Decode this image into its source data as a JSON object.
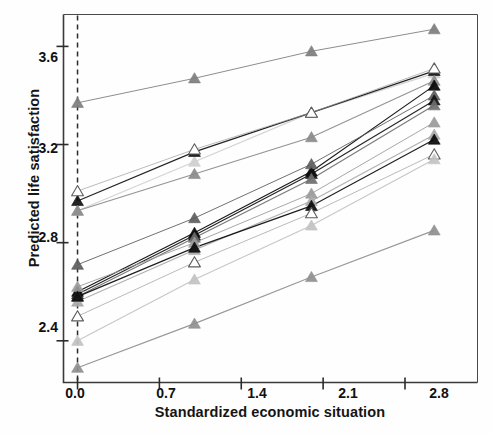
{
  "chart_data": {
    "type": "line",
    "title": "",
    "xlabel": "Standardized economic situation",
    "ylabel": "Predicted life satisfaction",
    "xlim": [
      -0.12,
      3.42
    ],
    "ylim": [
      2.23,
      3.73
    ],
    "xticks": [
      0.0,
      0.7,
      1.4,
      2.1,
      2.8
    ],
    "xtick_labels": [
      "0.0",
      "0.7",
      "1.4",
      "2.1",
      "2.8"
    ],
    "yticks": [
      2.4,
      2.8,
      3.2,
      3.6
    ],
    "ytick_labels": [
      "2.4",
      "2.8",
      "3.2",
      "3.6"
    ],
    "grid": false,
    "legend": "none",
    "marker": "triangle",
    "reference_line": {
      "orientation": "vertical",
      "x": 0.0,
      "style": "dashed"
    },
    "x": [
      0.0,
      1.0,
      2.0,
      3.05
    ],
    "series": [
      {
        "name": "series-01",
        "color": "#7d7d7d",
        "values": [
          3.37,
          3.47,
          3.58,
          3.67
        ]
      },
      {
        "name": "series-02",
        "color": "#cfcfcf",
        "values": [
          2.93,
          3.13,
          3.33,
          3.49
        ]
      },
      {
        "name": "series-03",
        "color": "#111111",
        "values": [
          2.97,
          3.17,
          3.33,
          3.5
        ]
      },
      {
        "name": "series-04",
        "color": "#ffffff",
        "values": [
          3.01,
          3.18,
          3.33,
          3.51
        ]
      },
      {
        "name": "series-05",
        "color": "#8a8a8a",
        "values": [
          2.93,
          3.08,
          3.23,
          3.46
        ]
      },
      {
        "name": "series-06",
        "color": "#050505",
        "values": [
          2.6,
          2.84,
          3.09,
          3.44
        ]
      },
      {
        "name": "series-07",
        "color": "#5c5c5c",
        "values": [
          2.71,
          2.9,
          3.12,
          3.4
        ]
      },
      {
        "name": "series-08",
        "color": "#111111",
        "values": [
          2.59,
          2.83,
          3.08,
          3.38
        ]
      },
      {
        "name": "series-09",
        "color": "#6e6e6e",
        "values": [
          2.58,
          2.82,
          3.06,
          3.36
        ]
      },
      {
        "name": "series-10",
        "color": "#9a9a9a",
        "values": [
          2.62,
          2.8,
          3.0,
          3.29
        ]
      },
      {
        "name": "series-11",
        "color": "#a8a8a8",
        "values": [
          2.56,
          2.77,
          2.97,
          3.24
        ]
      },
      {
        "name": "series-12",
        "color": "#0a0a0a",
        "values": [
          2.58,
          2.78,
          2.95,
          3.22
        ]
      },
      {
        "name": "series-13",
        "color": "#ffffff",
        "values": [
          2.5,
          2.72,
          2.92,
          3.16
        ]
      },
      {
        "name": "series-14",
        "color": "#c2c2c2",
        "values": [
          2.4,
          2.65,
          2.87,
          3.14
        ]
      },
      {
        "name": "series-15",
        "color": "#8f8f8f",
        "values": [
          2.29,
          2.47,
          2.66,
          2.85
        ]
      }
    ]
  },
  "axis": {
    "xlabel": "Standardized economic situation",
    "ylabel": "Predicted life satisfaction",
    "xtick_labels": [
      "0.0",
      "0.7",
      "1.4",
      "2.1",
      "2.8"
    ],
    "ytick_labels": [
      "2.4",
      "2.8",
      "3.2",
      "3.6"
    ]
  }
}
